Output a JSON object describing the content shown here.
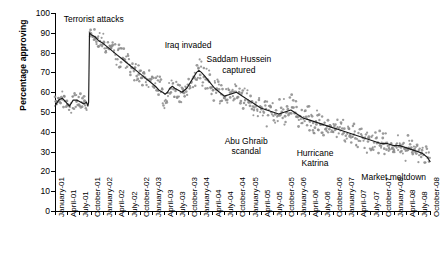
{
  "chart_data": {
    "type": "scatter",
    "title": "",
    "xlabel": "",
    "ylabel": "Percentage approving",
    "ylim": [
      0,
      100
    ],
    "yticks": [
      0,
      10,
      20,
      30,
      40,
      50,
      60,
      70,
      80,
      90,
      100
    ],
    "grid": false,
    "legend": "none",
    "xlim": [
      "January-01",
      "October-08"
    ],
    "categories": [
      "January-01",
      "April-01",
      "July-01",
      "October-01",
      "January-02",
      "April-02",
      "July-02",
      "October-02",
      "January-03",
      "April-03",
      "July-03",
      "October-03",
      "January-04",
      "April-04",
      "July-04",
      "October-04",
      "January-05",
      "April-05",
      "July-05",
      "October-05",
      "January-06",
      "April-06",
      "July-06",
      "October-06",
      "January-07",
      "April-07",
      "July-07",
      "October-07",
      "January-08",
      "April-08",
      "July-08",
      "October-08"
    ],
    "series": [
      {
        "name": "Percentage approving (trend)",
        "type": "line",
        "x": [
          0.0,
          0.3,
          0.6,
          0.9,
          1.2,
          1.5,
          1.8,
          2.1,
          2.4,
          2.6,
          2.72,
          2.78,
          2.85,
          3.0,
          3.3,
          3.6,
          3.9,
          4.3,
          4.7,
          5.1,
          5.5,
          5.9,
          6.3,
          6.7,
          7.1,
          7.5,
          7.9,
          8.3,
          8.6,
          8.9,
          9.1,
          9.3,
          9.5,
          9.7,
          9.9,
          10.2,
          10.5,
          10.9,
          11.3,
          11.7,
          11.9,
          12.1,
          12.4,
          12.8,
          13.2,
          13.6,
          14.0,
          14.5,
          15.0,
          15.5,
          16.0,
          16.5,
          17.0,
          17.5,
          18.0,
          18.5,
          19.0,
          19.5,
          20.0,
          20.5,
          21.0,
          21.5,
          22.0,
          22.5,
          23.0,
          23.5,
          24.0,
          24.5,
          25.0,
          25.5,
          26.0,
          26.5,
          27.0,
          27.5,
          28.0,
          28.5,
          29.0,
          29.5,
          30.0,
          30.4,
          30.8,
          31.0
        ],
        "values": [
          53,
          56,
          57,
          55,
          53,
          56,
          56,
          55,
          54,
          55,
          53,
          55,
          90,
          89,
          88,
          86,
          85,
          83,
          81,
          79,
          77,
          75,
          73,
          71,
          69,
          67,
          65,
          63,
          61,
          60,
          59,
          60,
          62,
          63,
          62,
          61,
          60,
          62,
          66,
          70,
          71,
          70,
          68,
          65,
          62,
          60,
          58,
          59,
          60,
          58,
          56,
          54,
          52,
          51,
          50,
          49,
          50,
          51,
          49,
          47,
          46,
          45,
          44,
          43,
          42,
          41,
          40,
          39,
          38,
          37,
          36,
          35,
          34,
          34,
          33,
          33,
          32,
          31,
          30,
          29,
          27,
          25
        ]
      },
      {
        "name": "Percentage approving (polls)",
        "type": "scatter",
        "note": "Individual poll readings scattered around the trend line, spread roughly +/- 3 points."
      }
    ],
    "annotations": [
      {
        "text": "Terrorist attacks",
        "x": 3.2,
        "y": 97
      },
      {
        "text": "Iraq invaded",
        "x": 11.0,
        "y": 84
      },
      {
        "text": "Saddam Hussein\ncaptured",
        "x": 15.2,
        "y": 74
      },
      {
        "text": "Abu Ghraib\nscandal",
        "x": 15.8,
        "y": 33
      },
      {
        "text": "Hurricane\nKatrina",
        "x": 21.5,
        "y": 27
      },
      {
        "text": "Market meltdown",
        "x": 28.0,
        "y": 17
      }
    ]
  }
}
